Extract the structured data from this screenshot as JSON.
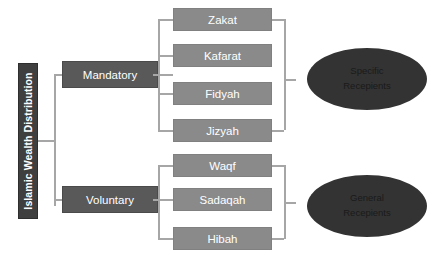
{
  "diagram": {
    "title": "Islamic Wealth Distribution",
    "root": {
      "label": "Islamic Wealth Distribution"
    },
    "categories": [
      {
        "label": "Mandatory",
        "items": [
          "Zakat",
          "Kafarat",
          "Fidyah",
          "Jizyah"
        ],
        "recipient": {
          "line1": "Specific",
          "line2": "Recepients"
        }
      },
      {
        "label": "Voluntary",
        "items": [
          "Waqf",
          "Sadaqah",
          "Hibah"
        ],
        "recipient": {
          "line1": "General",
          "line2": "Recepients"
        }
      }
    ],
    "colors": {
      "background": "#ffffff",
      "root_box": "#3f3f3f",
      "category_box": "#595959",
      "item_box": "#8a8a8a",
      "ellipse": "#333333",
      "connector": "#a6a6a6",
      "box_text": "#ffffff",
      "ellipse_text": "#1a1a1a"
    }
  }
}
